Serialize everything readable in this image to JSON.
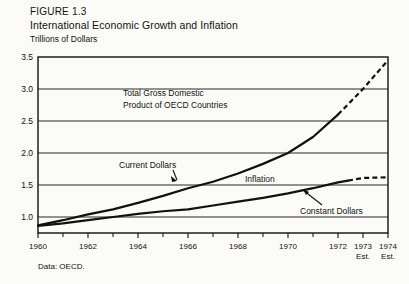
{
  "figure": {
    "label": "FIGURE 1.3",
    "title": "International Economic Growth and Inflation",
    "unit_label": "Trillions of Dollars",
    "source_note": "Data: OECD."
  },
  "chart_data": {
    "type": "line",
    "title": "International Economic Growth and Inflation",
    "xlabel": "",
    "ylabel": "Trillions of Dollars",
    "xlim": [
      1960,
      1974
    ],
    "ylim": [
      0.75,
      3.5
    ],
    "yticks": [
      "1.0",
      "1.5",
      "2.0",
      "2.5",
      "3.0",
      "3.5"
    ],
    "ytick_values": [
      1.0,
      1.5,
      2.0,
      2.5,
      3.0,
      3.5
    ],
    "xticks": [
      "1960",
      "1962",
      "1964",
      "1966",
      "1968",
      "1970",
      "1972",
      "1973",
      "1974"
    ],
    "xtick_values": [
      1960,
      1962,
      1964,
      1966,
      1968,
      1970,
      1972,
      1973,
      1974
    ],
    "xtick_minor_values": [
      1961,
      1963,
      1965,
      1967,
      1969,
      1971
    ],
    "estimate_markers": [
      {
        "year": 1973,
        "text": "Est."
      },
      {
        "year": 1974,
        "text": "Est."
      }
    ],
    "grid": "horizontal",
    "legend": "inline-annotations",
    "series": [
      {
        "name": "Current Dollars",
        "style": "solid-then-dashed",
        "dash_starts_at": 1972,
        "x": [
          1960,
          1961,
          1962,
          1963,
          1964,
          1965,
          1966,
          1967,
          1968,
          1969,
          1970,
          1971,
          1972,
          1973,
          1974
        ],
        "values": [
          0.87,
          0.95,
          1.04,
          1.12,
          1.22,
          1.33,
          1.45,
          1.55,
          1.68,
          1.83,
          2.0,
          2.25,
          2.6,
          3.0,
          3.45
        ]
      },
      {
        "name": "Constant Dollars",
        "style": "solid-then-dashed",
        "dash_starts_at": 1972.4,
        "x": [
          1960,
          1961,
          1962,
          1963,
          1964,
          1965,
          1966,
          1967,
          1968,
          1969,
          1970,
          1971,
          1972,
          1973,
          1974
        ],
        "values": [
          0.86,
          0.9,
          0.95,
          1.0,
          1.05,
          1.09,
          1.12,
          1.18,
          1.24,
          1.3,
          1.37,
          1.45,
          1.54,
          1.61,
          1.62
        ]
      }
    ],
    "annotations": [
      {
        "name": "chart-caption",
        "text_lines": [
          "Total Gross Domestic",
          "Product of OECD Countries"
        ]
      },
      {
        "name": "current-dollars-label",
        "text": "Current Dollars"
      },
      {
        "name": "inflation-label",
        "text": "Inflation"
      },
      {
        "name": "constant-dollars-label",
        "text": "Constant Dollars"
      }
    ]
  }
}
